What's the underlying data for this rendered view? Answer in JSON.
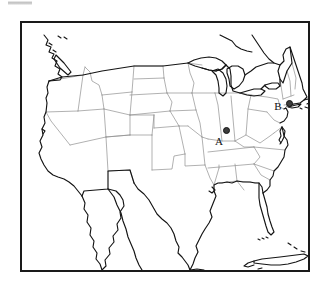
{
  "figure": {
    "type": "reference-map",
    "projection_note": "conic",
    "background_color": "#ffffff",
    "frame_color": "#1a1a1a",
    "coastline_color": "#111111",
    "state_border_color": "#8c8c8c",
    "marker_color": "#3d3d3d"
  },
  "artifact": {
    "name": "scan-artifact",
    "color": "#b8b8b8"
  },
  "map": {
    "frame": {
      "x": 20,
      "y": 21,
      "width": 290,
      "height": 251
    },
    "regions_shown": [
      "Contiguous United States",
      "Southern Canada",
      "Northern Mexico",
      "Baja California",
      "Cuba",
      "Bahamas",
      "Great Lakes",
      "Florida Keys",
      "Long Island",
      "Cape Cod",
      "Vancouver Island"
    ],
    "markers": [
      {
        "id": "A",
        "label": "A",
        "state": "Indiana",
        "dot_x": 204,
        "dot_y": 107,
        "label_x": 197,
        "label_y": 118
      },
      {
        "id": "B",
        "label": "B",
        "state": "Connecticut",
        "dot_x": 267,
        "dot_y": 80,
        "label_x": 256,
        "label_y": 83
      }
    ]
  }
}
